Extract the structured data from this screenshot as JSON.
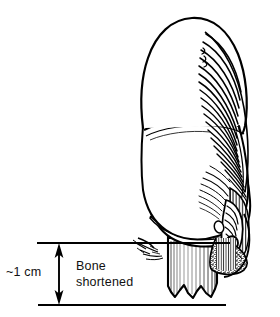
{
  "figure": {
    "kind": "anatomical-line-drawing",
    "background_color": "#ffffff",
    "ink_color": "#000000",
    "width": 280,
    "height": 317
  },
  "annotations": {
    "measurement_label": "~1 cm",
    "callout_label_line1": "Bone",
    "callout_label_line2": "shortened",
    "callout_label_full": "Bone shortened"
  },
  "measurement": {
    "upper_rule_y": 243,
    "lower_rule_y": 305,
    "upper_rule_x_start": 37,
    "upper_rule_x_end": 230,
    "lower_rule_x_start": 38,
    "lower_rule_x_end": 226,
    "arrow_x": 59,
    "arrow_top_y": 245,
    "arrow_bottom_y": 303,
    "value_text": "~1 cm"
  },
  "parts": {
    "fingertip_pulp": "soft tissue pad of distal fingertip",
    "nail_plate": "hatched nail plate on dorsal/right aspect",
    "nail_fold": "nail fold and eponychium detail",
    "distal_phalanx_stump": "shortened distal phalanx bone with jagged resected end",
    "flexor_crease": "transverse crease between pulp segments",
    "soft_tissue_stipple": "stippled cancellous / soft tissue region"
  },
  "colors": {
    "ink": "#000000",
    "paper": "#ffffff",
    "stipple": "#1a1a1a"
  }
}
